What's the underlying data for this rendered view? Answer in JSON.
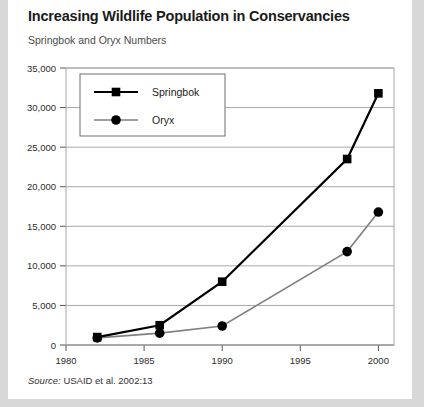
{
  "card": {
    "title": "Increasing Wildlife Population in Conservancies",
    "subtitle": "Springbok and Oryx Numbers",
    "source_label": "Source:",
    "source_text": "USAID et al. 2002:13"
  },
  "colors": {
    "springbok": "#000000",
    "oryx": "#808080",
    "grid": "#a8a8a8",
    "axis": "#555555",
    "card_bg": "#ffffff",
    "page_bg": "#d8d8d8"
  },
  "chart_data": {
    "type": "line",
    "title": "Increasing Wildlife Population in Conservancies",
    "subtitle": "Springbok and Oryx Numbers",
    "xlabel": "",
    "ylabel": "",
    "xlim": [
      1980,
      2001
    ],
    "ylim": [
      0,
      35000
    ],
    "grid": true,
    "legend_position": "top-left-inside",
    "x_ticks": [
      1980,
      1985,
      1990,
      1995,
      2000
    ],
    "x_tick_labels": [
      "1980",
      "1985",
      "1990",
      "1995",
      "2000"
    ],
    "y_ticks": [
      0,
      5000,
      10000,
      15000,
      20000,
      25000,
      30000,
      35000
    ],
    "y_tick_labels": [
      "0",
      "5,000",
      "10,000",
      "15,000",
      "20,000",
      "25,000",
      "30,000",
      "35,000"
    ],
    "series": [
      {
        "name": "Springbok",
        "color": "#000000",
        "marker": "square",
        "x": [
          1982,
          1986,
          1990,
          1998,
          2000
        ],
        "values": [
          1000,
          2500,
          8000,
          23500,
          31800
        ]
      },
      {
        "name": "Oryx",
        "color": "#808080",
        "marker": "circle",
        "x": [
          1982,
          1986,
          1990,
          1998,
          2000
        ],
        "values": [
          900,
          1500,
          2400,
          11800,
          16800
        ]
      }
    ]
  }
}
